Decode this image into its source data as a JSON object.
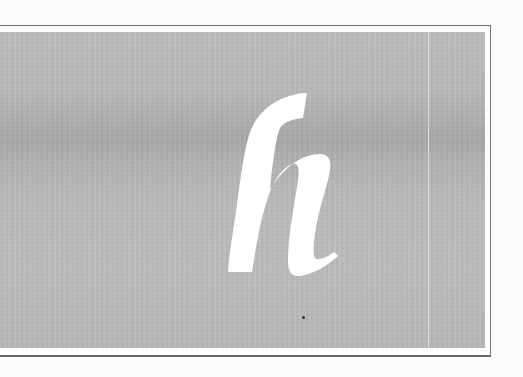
{
  "image": {
    "description": "Grayscale photograph-like panel with a large white italic lowercase letter",
    "glyph": "h",
    "colors": {
      "background": "#fbfbfb",
      "panel_gray": "#bcbcbc",
      "glyph": "#ffffff",
      "frame_line": "#6e6e6e"
    }
  }
}
